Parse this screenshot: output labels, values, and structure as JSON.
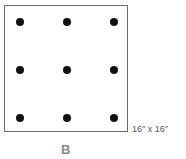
{
  "diagram": {
    "dimension_label": "16″ x 16″",
    "letter": "B",
    "grid": {
      "rows": 3,
      "cols": 3
    },
    "dots": [
      {
        "x": 20,
        "y": 22
      },
      {
        "x": 67,
        "y": 22
      },
      {
        "x": 114,
        "y": 22
      },
      {
        "x": 20,
        "y": 70
      },
      {
        "x": 67,
        "y": 70
      },
      {
        "x": 114,
        "y": 70
      },
      {
        "x": 20,
        "y": 118
      },
      {
        "x": 67,
        "y": 118
      },
      {
        "x": 114,
        "y": 118
      }
    ],
    "colors": {
      "border": "#6a6a6a",
      "dot": "#111111",
      "letter": "#8a8a8a"
    }
  }
}
